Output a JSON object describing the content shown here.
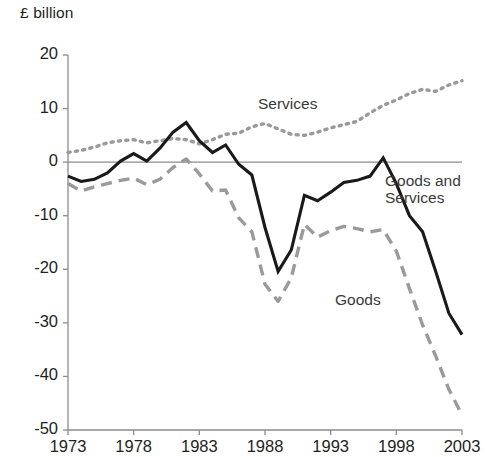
{
  "chart": {
    "axis_unit_label": "£ billion",
    "y_ticks": [
      "20",
      "10",
      "0",
      "-10",
      "-20",
      "-30",
      "-40",
      "-50"
    ],
    "x_ticks": [
      "1973",
      "1978",
      "1983",
      "1988",
      "1993",
      "1998",
      "2003"
    ],
    "series_labels": {
      "services": "Services",
      "goods_and_services": "Goods and\nServices",
      "goods": "Goods"
    },
    "colors": {
      "goods_and_services": "#1a1a1a",
      "goods": "#9a9a9a",
      "services": "#9a9a9a",
      "axis": "#8c8c8c",
      "zero_line": "#8c8c8c"
    }
  },
  "chart_data": {
    "type": "line",
    "title": "",
    "subtitle": "",
    "xlabel": "",
    "ylabel": "£ billion",
    "xlim": [
      1973,
      2003
    ],
    "ylim": [
      -50,
      20
    ],
    "ytick_values": [
      20,
      10,
      0,
      -10,
      -20,
      -30,
      -40,
      -50
    ],
    "xtick_values": [
      1973,
      1978,
      1983,
      1988,
      1993,
      1998,
      2003
    ],
    "grid": false,
    "zero_line": true,
    "legend": "inline-annotations",
    "x": [
      1973,
      1974,
      1975,
      1976,
      1977,
      1978,
      1979,
      1980,
      1981,
      1982,
      1983,
      1984,
      1985,
      1986,
      1987,
      1988,
      1989,
      1990,
      1991,
      1992,
      1993,
      1994,
      1995,
      1996,
      1997,
      1998,
      1999,
      2000,
      2001,
      2002,
      2003
    ],
    "series": [
      {
        "name": "Services",
        "style": "dotted",
        "color": "#9a9a9a",
        "values": [
          1.8,
          2.2,
          2.8,
          3.6,
          4.0,
          4.2,
          3.6,
          4.0,
          4.4,
          4.2,
          3.4,
          4.2,
          5.2,
          5.4,
          6.6,
          7.2,
          6.2,
          5.2,
          5.0,
          5.6,
          6.4,
          7.0,
          7.6,
          9.2,
          10.6,
          11.6,
          12.8,
          13.6,
          13.2,
          14.4,
          15.2
        ]
      },
      {
        "name": "Goods and Services",
        "style": "solid",
        "color": "#1a1a1a",
        "values": [
          -2.6,
          -3.6,
          -3.2,
          -2.0,
          0.2,
          1.6,
          0.2,
          2.6,
          5.6,
          7.4,
          4.0,
          1.8,
          3.2,
          -0.4,
          -2.4,
          -12.2,
          -20.4,
          -16.4,
          -6.2,
          -7.2,
          -5.6,
          -3.8,
          -3.4,
          -2.6,
          0.8,
          -4.0,
          -10.0,
          -13.0,
          -20.4,
          -28.2,
          -32.2
        ]
      },
      {
        "name": "Goods",
        "style": "dashed",
        "color": "#9a9a9a",
        "values": [
          -4.0,
          -5.4,
          -4.6,
          -4.0,
          -3.4,
          -3.0,
          -4.2,
          -3.2,
          -1.0,
          0.6,
          -2.2,
          -5.4,
          -5.2,
          -10.4,
          -13.0,
          -22.8,
          -26.0,
          -21.6,
          -11.6,
          -14.0,
          -12.8,
          -12.0,
          -12.4,
          -13.0,
          -12.6,
          -16.6,
          -23.6,
          -30.4,
          -36.2,
          -42.4,
          -47.2
        ]
      }
    ]
  }
}
